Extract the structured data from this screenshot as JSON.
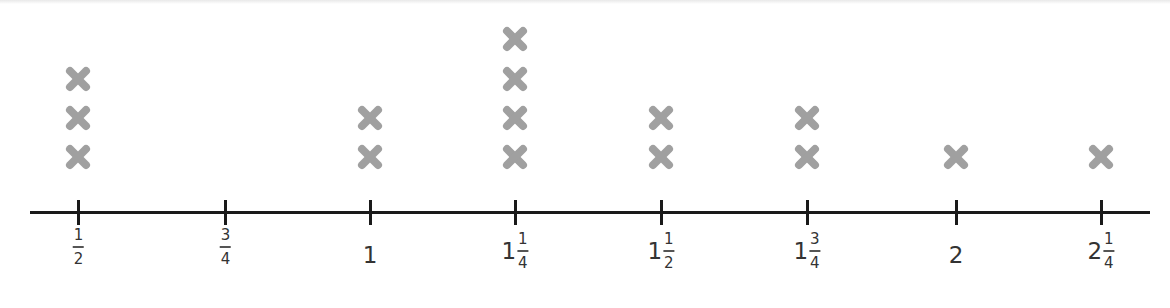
{
  "chart_data": {
    "type": "dot_plot",
    "title": "",
    "xlabel": "",
    "ylabel": "",
    "marker": "x-icon",
    "marker_color": "#a0a0a0",
    "axis_color": "#1a1a1a",
    "categories": [
      "1/2",
      "3/4",
      "1",
      "1 1/4",
      "1 1/2",
      "1 3/4",
      "2",
      "2 1/4"
    ],
    "x_values": [
      0.5,
      0.75,
      1.0,
      1.25,
      1.5,
      1.75,
      2.0,
      2.25
    ],
    "values": [
      3,
      0,
      2,
      4,
      2,
      2,
      1,
      1
    ],
    "ticks": [
      {
        "whole": "",
        "num": "1",
        "den": "2",
        "x": 78,
        "count": 3
      },
      {
        "whole": "",
        "num": "3",
        "den": "4",
        "x": 225,
        "count": 0
      },
      {
        "whole": "1",
        "num": "",
        "den": "",
        "x": 370,
        "count": 2
      },
      {
        "whole": "1",
        "num": "1",
        "den": "4",
        "x": 515,
        "count": 4
      },
      {
        "whole": "1",
        "num": "1",
        "den": "2",
        "x": 661,
        "count": 2
      },
      {
        "whole": "1",
        "num": "3",
        "den": "4",
        "x": 807,
        "count": 2
      },
      {
        "whole": "2",
        "num": "",
        "den": "",
        "x": 956,
        "count": 1
      },
      {
        "whole": "2",
        "num": "1",
        "den": "4",
        "x": 1101,
        "count": 1
      }
    ],
    "legend": null,
    "grid": false
  }
}
